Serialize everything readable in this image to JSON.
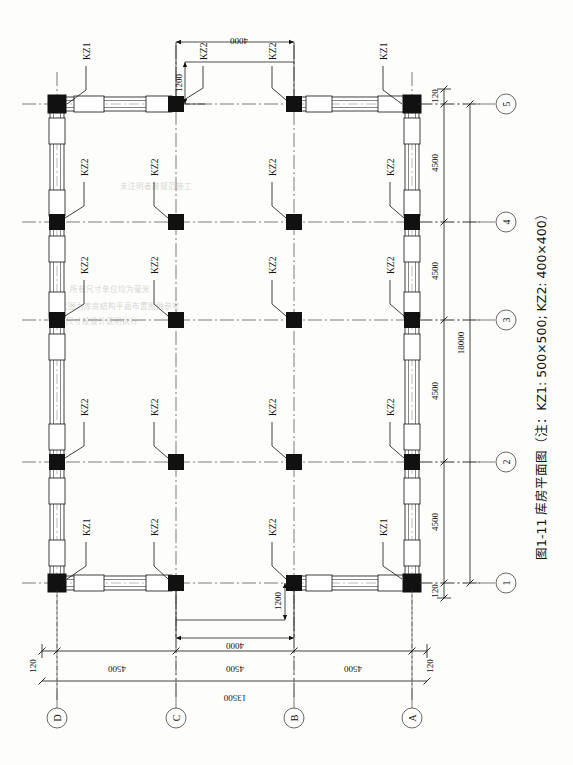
{
  "figure": {
    "caption": "图1-11  库房平面图（注：KZ1: 500×500; KZ2: 400×400）",
    "caption_number": "图1-11",
    "caption_title": "库房平面图",
    "caption_note": "（注：KZ1: 500×500; KZ2: 400×400）"
  },
  "colors": {
    "ink": "#111111",
    "paper": "#fdfdfb",
    "ghost": "#d8d7d2",
    "column_fill": "#111111",
    "wall_fill": "#ffffff"
  },
  "grid": {
    "horizontal_bubbles": [
      "D",
      "C",
      "B",
      "A"
    ],
    "vertical_bubbles": [
      "5",
      "4",
      "3",
      "2",
      "1"
    ],
    "horizontal_bubble_label": "轴线编号",
    "vertical_bubble_label": "轴线编号"
  },
  "dimensions": {
    "bottom_chain_outer": [
      "120",
      "4500",
      "4500",
      "4500",
      "120"
    ],
    "bottom_total": "13500",
    "right_chain_outer": [
      "120",
      "4500",
      "4500",
      "4500",
      "4500",
      "120"
    ],
    "right_total": "18000",
    "top_opening_width": "4000",
    "top_opening_offset": "1200",
    "bottom_opening_width": "4000",
    "bottom_opening_offset": "1200",
    "bay_spacing_x": "4500",
    "bay_spacing_y": "4500",
    "wall_thickness": "120"
  },
  "columns": {
    "types": [
      {
        "tag": "KZ1",
        "size": "500×500"
      },
      {
        "tag": "KZ2",
        "size": "400×400"
      }
    ],
    "callouts_row5": [
      "KZ1",
      "KZ2",
      "KZ2",
      "KZ1"
    ],
    "callouts_row4": [
      "KZ2",
      "KZ2",
      "KZ2",
      "KZ2"
    ],
    "callouts_row3": [
      "KZ2",
      "KZ2",
      "KZ2",
      "KZ2"
    ],
    "callouts_row2": [
      "KZ2",
      "KZ2",
      "KZ2",
      "KZ2"
    ],
    "callouts_row1": [
      "KZ1",
      "KZ2",
      "KZ2",
      "KZ1"
    ]
  },
  "ghost_text": {
    "lines": [
      "此图为库房结构平面布置图供参考",
      "柱网尺寸按设计说明执行",
      "所有尺寸单位均为毫米",
      "未注明者按规范施工"
    ]
  }
}
